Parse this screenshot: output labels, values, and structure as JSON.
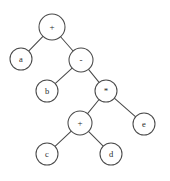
{
  "figure": {
    "kind": "binary-expression-tree",
    "expression": "a + (b - ((c + d) * e))",
    "background_color": "#ffffff",
    "stroke_color": "#4a4a4a",
    "label_color": "#2b2b2b",
    "width": 170,
    "height": 181
  },
  "nodes": [
    {
      "id": "n0",
      "label": "+",
      "type": "operator",
      "x": 52,
      "y": 27,
      "r": 13
    },
    {
      "id": "n1",
      "label": "a",
      "type": "operand",
      "x": 21,
      "y": 59,
      "r": 11
    },
    {
      "id": "n2",
      "label": "-",
      "type": "operator",
      "x": 81,
      "y": 60,
      "r": 12
    },
    {
      "id": "n3",
      "label": "b",
      "type": "operand",
      "x": 47,
      "y": 91,
      "r": 11
    },
    {
      "id": "n4",
      "label": "*",
      "type": "operator",
      "x": 106,
      "y": 91,
      "r": 11
    },
    {
      "id": "n5",
      "label": "+",
      "type": "operator",
      "x": 80,
      "y": 123,
      "r": 12
    },
    {
      "id": "n6",
      "label": "e",
      "type": "operand",
      "x": 144,
      "y": 124,
      "r": 11
    },
    {
      "id": "n7",
      "label": "c",
      "type": "operand",
      "x": 47,
      "y": 154,
      "r": 11
    },
    {
      "id": "n8",
      "label": "d",
      "type": "operand",
      "x": 111,
      "y": 154,
      "r": 11
    }
  ],
  "edges": [
    {
      "from": "n0",
      "to": "n1",
      "side": "left"
    },
    {
      "from": "n0",
      "to": "n2",
      "side": "right"
    },
    {
      "from": "n2",
      "to": "n3",
      "side": "left"
    },
    {
      "from": "n2",
      "to": "n4",
      "side": "right"
    },
    {
      "from": "n4",
      "to": "n5",
      "side": "left"
    },
    {
      "from": "n4",
      "to": "n6",
      "side": "right"
    },
    {
      "from": "n5",
      "to": "n7",
      "side": "left"
    },
    {
      "from": "n5",
      "to": "n8",
      "side": "right"
    }
  ]
}
